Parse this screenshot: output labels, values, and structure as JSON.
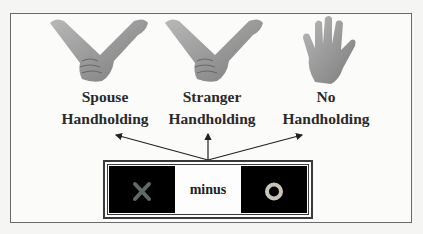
{
  "figure": {
    "conditions": [
      {
        "line1": "Spouse",
        "line2": "Handholding",
        "icon": "two-hands-holding"
      },
      {
        "line1": "Stranger",
        "line2": "Handholding",
        "icon": "two-hands-holding"
      },
      {
        "line1": "No",
        "line2": "Handholding",
        "icon": "open-hand"
      }
    ],
    "stimulus": {
      "left_symbol": "X",
      "operator": "minus",
      "right_symbol": "O"
    },
    "colors": {
      "frame": "#6a6a6a",
      "skin": "#9a9a9a",
      "stim_bg": "#000000",
      "x_color": "#5f6a63",
      "o_color": "#c8c4b8"
    }
  }
}
